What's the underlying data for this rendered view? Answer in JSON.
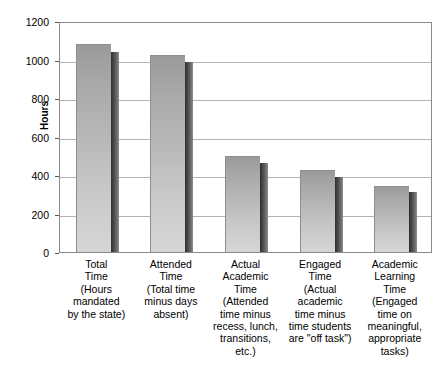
{
  "chart_data": {
    "type": "bar",
    "title": "",
    "xlabel": "",
    "ylabel": "Hours",
    "ylim": [
      0,
      1200
    ],
    "ytick_step": 200,
    "yticks": [
      0,
      200,
      400,
      600,
      800,
      1000,
      1200
    ],
    "grid": true,
    "legend": "none",
    "style": "3d-shadow-bars",
    "categories": [
      "Total Time",
      "Attended Time",
      "Actual Academic Time",
      "Engaged Time",
      "Academic Learning Time"
    ],
    "values": [
      1080,
      1025,
      500,
      425,
      345
    ],
    "shadow_values": [
      1040,
      985,
      460,
      390,
      310
    ],
    "bars": [
      {
        "name_lines": [
          "Total",
          "Time"
        ],
        "description_lines": [
          "(Hours",
          "mandated",
          "by the state)"
        ],
        "value": 1080
      },
      {
        "name_lines": [
          "Attended",
          "Time"
        ],
        "description_lines": [
          "(Total time",
          "minus days",
          "absent)"
        ],
        "value": 1025
      },
      {
        "name_lines": [
          "Actual",
          "Academic",
          "Time"
        ],
        "description_lines": [
          "(Attended",
          "time minus",
          "recess, lunch,",
          "transitions,",
          "etc.)"
        ],
        "value": 500
      },
      {
        "name_lines": [
          "Engaged",
          "Time"
        ],
        "description_lines": [
          "(Actual",
          "academic",
          "time minus",
          "time students",
          "are \"off task\")"
        ],
        "value": 425
      },
      {
        "name_lines": [
          "Academic",
          "Learning",
          "Time"
        ],
        "description_lines": [
          "(Engaged",
          "time on",
          "meaningful,",
          "appropriate",
          "tasks)"
        ],
        "value": 345
      }
    ]
  },
  "colors": {
    "bar_face_top": "#9a9a9a",
    "bar_face_bottom": "#d6d6d6",
    "bar_shadow": "#2e2e2e",
    "gridline": "#b4b4b4",
    "frame": "#8a8a8a",
    "text": "#000000",
    "background": "#ffffff"
  }
}
